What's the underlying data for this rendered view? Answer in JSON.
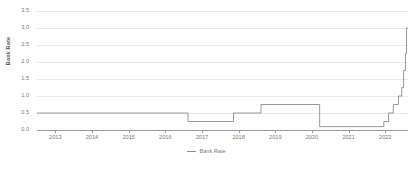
{
  "chart_data": {
    "type": "line",
    "title": "",
    "xlabel": "",
    "ylabel": "Bank Rate",
    "ylim": [
      0.0,
      3.5
    ],
    "xlim": [
      2012.5,
      2022.62
    ],
    "grid": true,
    "legend_position": "bottom",
    "line_style": "step-post",
    "yticks": [
      "0.0",
      "0.5",
      "1.0",
      "1.5",
      "2.0",
      "2.5",
      "3.0",
      "3.5"
    ],
    "ytick_values": [
      0.0,
      0.5,
      1.0,
      1.5,
      2.0,
      2.5,
      3.0,
      3.5
    ],
    "xticks": [
      "2013",
      "2014",
      "2015",
      "2016",
      "2017",
      "2018",
      "2019",
      "2020",
      "2021",
      "2022"
    ],
    "xtick_values": [
      2013,
      2014,
      2015,
      2016,
      2017,
      2018,
      2019,
      2020,
      2021,
      2022
    ],
    "series": [
      {
        "name": "Bank Rate",
        "color": "#8c8c8c",
        "x": [
          2012.5,
          2016.62,
          2017.86,
          2018.61,
          2020.21,
          2021.96,
          2022.09,
          2022.22,
          2022.36,
          2022.45,
          2022.5,
          2022.55,
          2022.58,
          2022.62
        ],
        "values": [
          0.5,
          0.25,
          0.5,
          0.75,
          0.1,
          0.25,
          0.5,
          0.75,
          1.0,
          1.25,
          1.75,
          2.25,
          3.0,
          3.0
        ]
      }
    ]
  },
  "legend": {
    "entries": [
      {
        "label": "Bank Rate",
        "color": "#8c8c8c"
      }
    ]
  },
  "axes": {
    "y_title": "Bank Rate"
  },
  "colors": {
    "line": "#8c8c8c",
    "grid": "#e9e9e9",
    "axis": "#9a9a9a",
    "text": "#7a7a7a",
    "background": "#ffffff"
  }
}
